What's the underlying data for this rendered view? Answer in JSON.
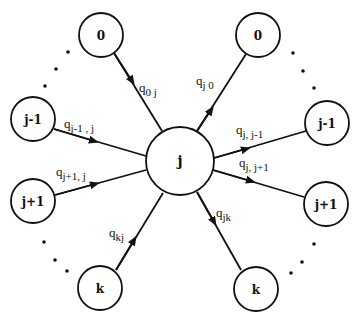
{
  "diagram": {
    "type": "state-transition-graph",
    "center_node": {
      "label": "j"
    },
    "incoming_nodes": [
      {
        "id": "in-0",
        "label": "0"
      },
      {
        "id": "in-j-minus-1",
        "label": "j-1"
      },
      {
        "id": "in-j-plus-1",
        "label": "j+1"
      },
      {
        "id": "in-k",
        "label": "k"
      }
    ],
    "outgoing_nodes": [
      {
        "id": "out-0",
        "label": "0"
      },
      {
        "id": "out-j-minus-1",
        "label": "j-1"
      },
      {
        "id": "out-j-plus-1",
        "label": "j+1"
      },
      {
        "id": "out-k",
        "label": "k"
      }
    ],
    "incoming_edges": [
      {
        "from": "0",
        "to": "j",
        "q": "q",
        "sub": "0 j"
      },
      {
        "from": "j-1",
        "to": "j",
        "q": "q",
        "sub": "j-1 , j"
      },
      {
        "from": "j+1",
        "to": "j",
        "q": "q",
        "sub": "j+1, j"
      },
      {
        "from": "k",
        "to": "j",
        "q": "q",
        "sub": "kj"
      }
    ],
    "outgoing_edges": [
      {
        "from": "j",
        "to": "0",
        "q": "q",
        "sub": "j 0"
      },
      {
        "from": "j",
        "to": "j-1",
        "q": "q",
        "sub": "j, j-1"
      },
      {
        "from": "j",
        "to": "j+1",
        "q": "q",
        "sub": "j, j+1"
      },
      {
        "from": "j",
        "to": "k",
        "q": "q",
        "sub": "jk"
      }
    ],
    "ellipsis": "..."
  }
}
